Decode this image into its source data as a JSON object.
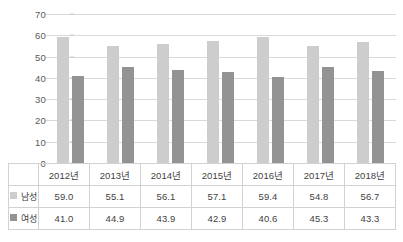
{
  "chart_data": {
    "type": "bar",
    "title": "",
    "xlabel": "",
    "ylabel": "",
    "ylim": [
      0,
      70
    ],
    "yticks": [
      70,
      60,
      50,
      40,
      30,
      20,
      10,
      0
    ],
    "grid": true,
    "legend_position": "table-left",
    "categories": [
      "2012년",
      "2013년",
      "2014년",
      "2015년",
      "2016년",
      "2017년",
      "2018년"
    ],
    "series": [
      {
        "name": "남성",
        "color": "#cdcdcd",
        "values": [
          59.0,
          55.1,
          56.1,
          57.1,
          59.4,
          54.8,
          56.7
        ],
        "labels": [
          "59.0",
          "55.1",
          "56.1",
          "57.1",
          "59.4",
          "54.8",
          "56.7"
        ]
      },
      {
        "name": "여성",
        "color": "#939393",
        "values": [
          41.0,
          44.9,
          43.9,
          42.9,
          40.6,
          45.3,
          43.3
        ],
        "labels": [
          "41.0",
          "44.9",
          "43.9",
          "42.9",
          "40.6",
          "45.3",
          "43.3"
        ]
      }
    ]
  },
  "footer": {
    "text": ""
  }
}
